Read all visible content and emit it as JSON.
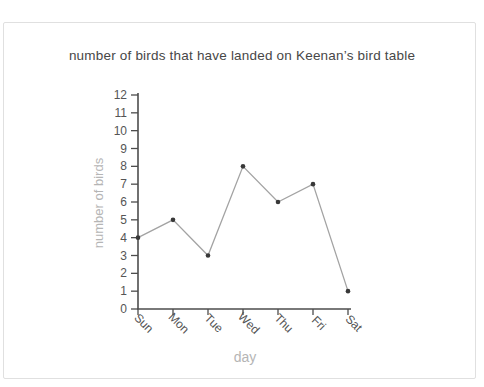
{
  "chart_data": {
    "type": "line",
    "title": "number of birds that have landed on Keenan’s bird table",
    "xlabel": "day",
    "ylabel": "number of birds",
    "categories": [
      "Sun",
      "Mon",
      "Tue",
      "Wed",
      "Thu",
      "Fri",
      "Sat"
    ],
    "values": [
      4,
      5,
      3,
      8,
      6,
      7,
      1
    ],
    "ylim": [
      0,
      12
    ],
    "ytick_step": 1,
    "grid": false,
    "legend": "none",
    "marker": "dot"
  },
  "colors": {
    "title": "#474747",
    "axis": "#4d4d4d",
    "tick_label": "#555555",
    "axis_title": "#b5b5b5",
    "line": "#a3a3a3",
    "marker": "#383838",
    "card_border": "#e0e0e0",
    "card_bg": "#ffffff"
  }
}
